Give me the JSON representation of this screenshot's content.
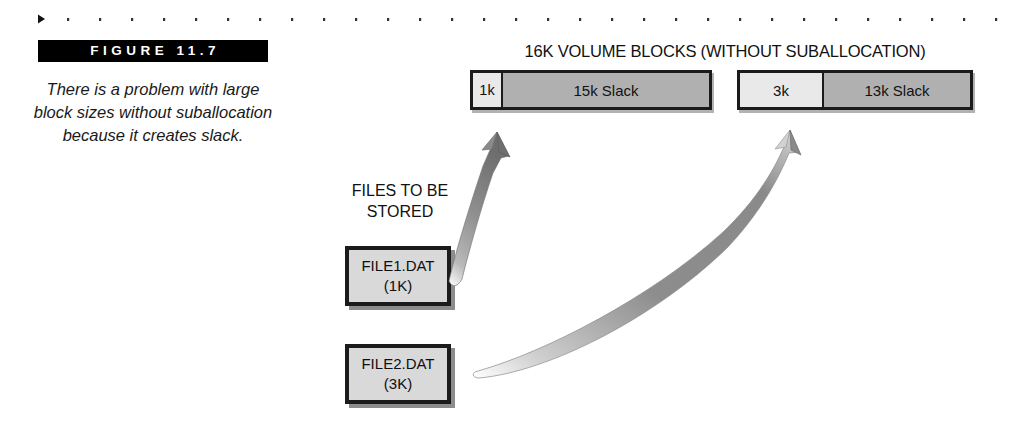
{
  "figure": {
    "label": "FIGURE 11.7",
    "caption": "There is a problem with large block sizes without suballocation because it creates slack."
  },
  "diagram": {
    "blocks_heading": "16K VOLUME BLOCKS (WITHOUT SUBALLOCATION)",
    "files_label": "FILES TO BE STORED",
    "volume_blocks": [
      {
        "used_label": "1k",
        "slack_label": "15k Slack",
        "used_kb": 1,
        "slack_kb": 15,
        "total_kb": 16
      },
      {
        "used_label": "3k",
        "slack_label": "13k Slack",
        "used_kb": 3,
        "slack_kb": 13,
        "total_kb": 16
      }
    ],
    "files": [
      {
        "name": "FILE1.DAT",
        "size": "(1K)"
      },
      {
        "name": "FILE2.DAT",
        "size": "(3K)"
      }
    ],
    "arrows": [
      {
        "from": "FILE1.DAT",
        "to": "block-1"
      },
      {
        "from": "FILE2.DAT",
        "to": "block-2"
      }
    ]
  },
  "colors": {
    "used_segment": "#e9e9e9",
    "slack_segment": "#b0b0b0",
    "box_fill": "#d9d9d9",
    "outline": "#1b1b1b",
    "bar_background": "#000000",
    "bar_text": "#ffffff"
  }
}
